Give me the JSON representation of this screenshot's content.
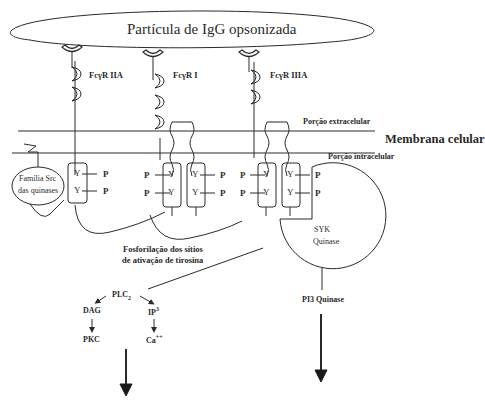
{
  "particle": {
    "label": "Partícula de IgG opsonizada"
  },
  "receptors": [
    {
      "label": "FcγR IIA"
    },
    {
      "label": "FcγR I"
    },
    {
      "label": "FcγR IIIA"
    }
  ],
  "membrane": {
    "label": "Membrana celular",
    "extracellular_label": "Porção extracelular",
    "intracellular_label": "Porção intracelular"
  },
  "src_family": {
    "line1": "Família Src",
    "line2": "das quinases"
  },
  "tyrosine": {
    "symbol": "Y",
    "phosphate": "P"
  },
  "phosphorylation": {
    "line1": "Fosforilação dos sítios",
    "line2": "de ativação de tirosina"
  },
  "syk": {
    "line1": "SYK",
    "line2": "Quinase"
  },
  "pathway_left": {
    "plc": "PLC",
    "plc_sub": "2",
    "dag": "DAG",
    "ip": "IP",
    "ip_sup": "3",
    "pkc": "PKC",
    "ca": "Ca",
    "ca_sup": "++"
  },
  "pathway_right": {
    "pi3": "PI3  Quinase"
  },
  "colors": {
    "stroke": "#2a2a2a",
    "background": "#ffffff"
  }
}
